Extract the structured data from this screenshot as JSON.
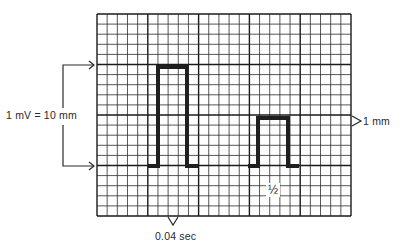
{
  "diagram": {
    "grid": {
      "small_squares_x": 25,
      "small_squares_y": 20,
      "squares_per_large": 5,
      "small_square_value": "1 mm",
      "line_color": "#2b2b2b",
      "major_line_color": "#1a1a1a"
    },
    "pulses": [
      {
        "name": "full standard",
        "height_mm": 10,
        "width_small_squares": 3
      },
      {
        "name": "half standard",
        "height_mm": 5,
        "width_small_squares": 3
      }
    ],
    "pulse_color": "#1f1f1f"
  },
  "labels": {
    "amplitude": "1 mV = 10 mm",
    "small_square_height": "1 mm",
    "half_standard": "½",
    "small_square_time": "0.04 sec"
  }
}
